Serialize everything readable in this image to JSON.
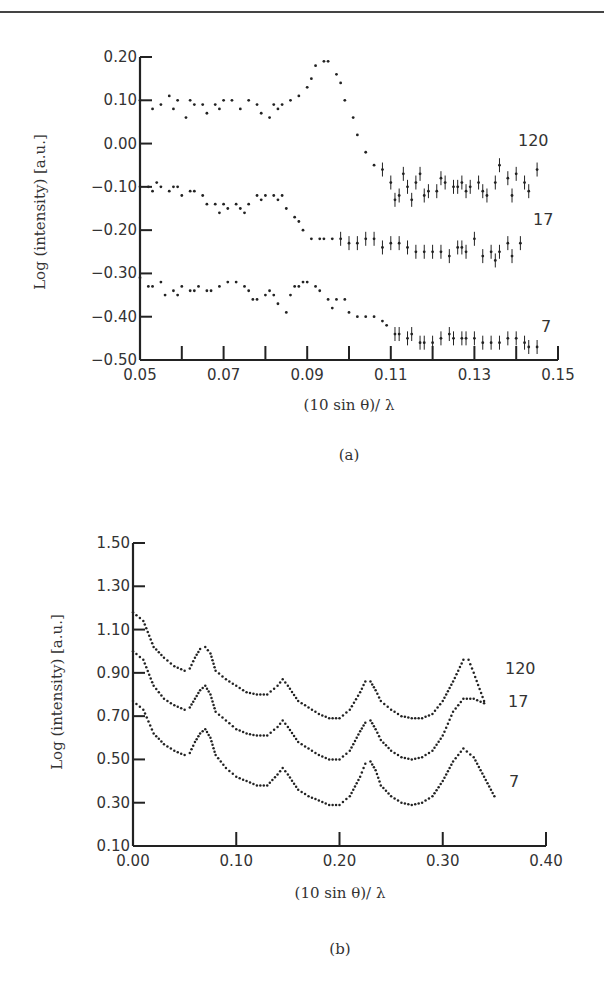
{
  "chart_data": [
    {
      "panel": "(a)",
      "type": "scatter",
      "title": "",
      "xlabel": "(10 sin θ)/ λ",
      "ylabel": "Log (intensity) [a.u.]",
      "xlim": [
        0.05,
        0.15
      ],
      "ylim": [
        -0.5,
        0.2
      ],
      "xticks": [
        "0.05",
        "0.07",
        "0.09",
        "0.11",
        "0.13",
        "0.15"
      ],
      "yticks": [
        "0.20",
        "0.10",
        "0.00",
        "-0.10",
        "-0.20",
        "-0.30",
        "-0.40",
        "-0.50"
      ],
      "grid": false,
      "legend": "inline labels at right",
      "series": [
        {
          "name": "120",
          "x": [
            0.05,
            0.053,
            0.055,
            0.057,
            0.058,
            0.059,
            0.061,
            0.062,
            0.063,
            0.065,
            0.066,
            0.068,
            0.069,
            0.07,
            0.072,
            0.074,
            0.076,
            0.078,
            0.079,
            0.081,
            0.082,
            0.083,
            0.084,
            0.086,
            0.088,
            0.09,
            0.091,
            0.092,
            0.094,
            0.095,
            0.097,
            0.098,
            0.099,
            0.101,
            0.102,
            0.104,
            0.106,
            0.108,
            0.11,
            0.111,
            0.112,
            0.113,
            0.114,
            0.115,
            0.116,
            0.117,
            0.118,
            0.119,
            0.121,
            0.122,
            0.123,
            0.125,
            0.126,
            0.127,
            0.128,
            0.129,
            0.131,
            0.132,
            0.133,
            0.135,
            0.136,
            0.138,
            0.139,
            0.14,
            0.142,
            0.143,
            0.145
          ],
          "y": [
            0.1,
            0.08,
            0.09,
            0.11,
            0.08,
            0.1,
            0.06,
            0.1,
            0.09,
            0.09,
            0.07,
            0.09,
            0.08,
            0.1,
            0.1,
            0.08,
            0.1,
            0.09,
            0.07,
            0.06,
            0.09,
            0.08,
            0.09,
            0.1,
            0.11,
            0.13,
            0.15,
            0.18,
            0.19,
            0.19,
            0.16,
            0.14,
            0.1,
            0.06,
            0.02,
            -0.02,
            -0.05,
            -0.06,
            -0.09,
            -0.13,
            -0.12,
            -0.07,
            -0.1,
            -0.13,
            -0.09,
            -0.07,
            -0.12,
            -0.11,
            -0.11,
            -0.08,
            -0.09,
            -0.1,
            -0.1,
            -0.09,
            -0.11,
            -0.1,
            -0.09,
            -0.11,
            -0.12,
            -0.09,
            -0.05,
            -0.08,
            -0.12,
            -0.07,
            -0.09,
            -0.11,
            -0.06
          ]
        },
        {
          "name": "17",
          "x": [
            0.05,
            0.052,
            0.053,
            0.054,
            0.055,
            0.057,
            0.058,
            0.059,
            0.06,
            0.062,
            0.063,
            0.065,
            0.066,
            0.068,
            0.069,
            0.07,
            0.071,
            0.073,
            0.074,
            0.075,
            0.076,
            0.078,
            0.079,
            0.08,
            0.082,
            0.083,
            0.084,
            0.085,
            0.087,
            0.088,
            0.089,
            0.091,
            0.093,
            0.094,
            0.096,
            0.098,
            0.1,
            0.102,
            0.104,
            0.106,
            0.108,
            0.11,
            0.112,
            0.114,
            0.116,
            0.118,
            0.12,
            0.122,
            0.124,
            0.126,
            0.127,
            0.128,
            0.13,
            0.132,
            0.134,
            0.135,
            0.136,
            0.138,
            0.139,
            0.141
          ],
          "y": [
            -0.1,
            -0.1,
            -0.11,
            -0.09,
            -0.1,
            -0.11,
            -0.1,
            -0.1,
            -0.12,
            -0.11,
            -0.11,
            -0.12,
            -0.14,
            -0.14,
            -0.16,
            -0.14,
            -0.15,
            -0.14,
            -0.15,
            -0.16,
            -0.14,
            -0.12,
            -0.13,
            -0.12,
            -0.12,
            -0.13,
            -0.12,
            -0.15,
            -0.17,
            -0.18,
            -0.2,
            -0.22,
            -0.22,
            -0.22,
            -0.22,
            -0.22,
            -0.23,
            -0.23,
            -0.22,
            -0.22,
            -0.24,
            -0.23,
            -0.23,
            -0.24,
            -0.25,
            -0.25,
            -0.25,
            -0.25,
            -0.26,
            -0.24,
            -0.24,
            -0.25,
            -0.22,
            -0.26,
            -0.25,
            -0.27,
            -0.25,
            -0.23,
            -0.26,
            -0.23
          ]
        },
        {
          "name": "7",
          "x": [
            0.05,
            0.052,
            0.053,
            0.055,
            0.056,
            0.058,
            0.059,
            0.06,
            0.062,
            0.063,
            0.064,
            0.066,
            0.067,
            0.069,
            0.071,
            0.073,
            0.075,
            0.076,
            0.077,
            0.078,
            0.08,
            0.081,
            0.082,
            0.083,
            0.085,
            0.086,
            0.087,
            0.088,
            0.089,
            0.09,
            0.092,
            0.093,
            0.095,
            0.096,
            0.097,
            0.099,
            0.1,
            0.102,
            0.104,
            0.106,
            0.108,
            0.109,
            0.111,
            0.112,
            0.114,
            0.115,
            0.117,
            0.118,
            0.12,
            0.122,
            0.124,
            0.125,
            0.127,
            0.128,
            0.13,
            0.132,
            0.134,
            0.136,
            0.138,
            0.14,
            0.142,
            0.143,
            0.145
          ],
          "y": [
            -0.31,
            -0.33,
            -0.33,
            -0.32,
            -0.35,
            -0.34,
            -0.35,
            -0.33,
            -0.34,
            -0.34,
            -0.33,
            -0.34,
            -0.34,
            -0.33,
            -0.32,
            -0.32,
            -0.33,
            -0.34,
            -0.36,
            -0.36,
            -0.35,
            -0.34,
            -0.35,
            -0.37,
            -0.39,
            -0.35,
            -0.33,
            -0.33,
            -0.32,
            -0.32,
            -0.33,
            -0.34,
            -0.36,
            -0.38,
            -0.36,
            -0.36,
            -0.39,
            -0.4,
            -0.4,
            -0.4,
            -0.41,
            -0.42,
            -0.44,
            -0.44,
            -0.45,
            -0.44,
            -0.46,
            -0.46,
            -0.46,
            -0.45,
            -0.44,
            -0.45,
            -0.45,
            -0.45,
            -0.45,
            -0.46,
            -0.46,
            -0.46,
            -0.45,
            -0.45,
            -0.46,
            -0.47,
            -0.47
          ]
        }
      ]
    },
    {
      "panel": "(b)",
      "type": "line",
      "title": "",
      "xlabel": "(10 sin θ)/ λ",
      "ylabel": "Log (intensity) [a.u.]",
      "xlim": [
        0.0,
        0.4
      ],
      "ylim": [
        0.1,
        1.5
      ],
      "xticks": [
        "0.00",
        "0.10",
        "0.20",
        "0.30",
        "0.40"
      ],
      "yticks": [
        "1.50",
        "1.30",
        "1.10",
        "0.90",
        "0.70",
        "0.50",
        "0.30",
        "0.10"
      ],
      "grid": false,
      "legend": "inline labels at right",
      "series": [
        {
          "name": "120",
          "x": [
            0.0,
            0.01,
            0.02,
            0.03,
            0.04,
            0.05,
            0.055,
            0.06,
            0.065,
            0.07,
            0.075,
            0.08,
            0.09,
            0.1,
            0.11,
            0.12,
            0.13,
            0.14,
            0.145,
            0.15,
            0.16,
            0.17,
            0.18,
            0.19,
            0.2,
            0.21,
            0.22,
            0.225,
            0.23,
            0.235,
            0.24,
            0.25,
            0.26,
            0.27,
            0.28,
            0.29,
            0.3,
            0.31,
            0.32,
            0.325,
            0.33,
            0.34
          ],
          "y": [
            1.18,
            1.14,
            1.02,
            0.97,
            0.93,
            0.91,
            0.92,
            0.97,
            1.01,
            1.02,
            0.99,
            0.91,
            0.87,
            0.84,
            0.81,
            0.8,
            0.8,
            0.84,
            0.87,
            0.84,
            0.77,
            0.74,
            0.71,
            0.69,
            0.69,
            0.73,
            0.81,
            0.86,
            0.86,
            0.82,
            0.77,
            0.73,
            0.7,
            0.69,
            0.69,
            0.71,
            0.77,
            0.86,
            0.96,
            0.96,
            0.9,
            0.77
          ]
        },
        {
          "name": "17",
          "x": [
            0.0,
            0.01,
            0.02,
            0.03,
            0.04,
            0.05,
            0.055,
            0.06,
            0.065,
            0.07,
            0.075,
            0.08,
            0.09,
            0.1,
            0.11,
            0.12,
            0.13,
            0.14,
            0.145,
            0.15,
            0.16,
            0.17,
            0.18,
            0.19,
            0.2,
            0.21,
            0.22,
            0.225,
            0.23,
            0.235,
            0.24,
            0.25,
            0.26,
            0.27,
            0.28,
            0.29,
            0.3,
            0.31,
            0.32,
            0.33,
            0.34
          ],
          "y": [
            1.0,
            0.96,
            0.84,
            0.78,
            0.75,
            0.73,
            0.74,
            0.78,
            0.82,
            0.84,
            0.8,
            0.72,
            0.68,
            0.64,
            0.62,
            0.61,
            0.61,
            0.65,
            0.68,
            0.65,
            0.58,
            0.55,
            0.52,
            0.5,
            0.5,
            0.54,
            0.63,
            0.67,
            0.68,
            0.64,
            0.59,
            0.54,
            0.51,
            0.5,
            0.51,
            0.54,
            0.61,
            0.72,
            0.78,
            0.78,
            0.76
          ]
        },
        {
          "name": "7",
          "x": [
            0.0,
            0.01,
            0.02,
            0.03,
            0.04,
            0.05,
            0.055,
            0.06,
            0.065,
            0.07,
            0.075,
            0.08,
            0.09,
            0.1,
            0.11,
            0.12,
            0.13,
            0.14,
            0.145,
            0.15,
            0.16,
            0.17,
            0.18,
            0.19,
            0.2,
            0.21,
            0.22,
            0.225,
            0.23,
            0.235,
            0.24,
            0.25,
            0.26,
            0.27,
            0.28,
            0.29,
            0.3,
            0.31,
            0.32,
            0.33,
            0.34,
            0.35
          ],
          "y": [
            0.77,
            0.73,
            0.62,
            0.57,
            0.54,
            0.52,
            0.53,
            0.58,
            0.62,
            0.64,
            0.6,
            0.52,
            0.46,
            0.42,
            0.4,
            0.38,
            0.38,
            0.43,
            0.46,
            0.43,
            0.36,
            0.33,
            0.31,
            0.29,
            0.29,
            0.33,
            0.42,
            0.48,
            0.49,
            0.45,
            0.38,
            0.33,
            0.3,
            0.29,
            0.3,
            0.33,
            0.4,
            0.49,
            0.55,
            0.51,
            0.42,
            0.33
          ]
        }
      ]
    }
  ],
  "panels": {
    "a": {
      "caption": "(a)",
      "xlabel": "(10 sin θ)/ λ",
      "ylabel": "Log (intensity) [a.u.]",
      "series_labels": [
        "120",
        "17",
        "7"
      ]
    },
    "b": {
      "caption": "(b)",
      "xlabel": "(10 sin θ)/ λ",
      "ylabel": "Log (intensity) [a.u.]",
      "series_labels": [
        "120",
        "17",
        "7"
      ]
    }
  },
  "colors": {
    "ink": "#222222",
    "background": "#ffffff"
  }
}
